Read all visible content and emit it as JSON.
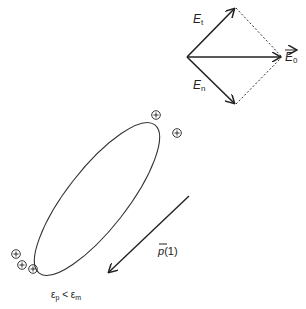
{
  "vectors": {
    "tangential": {
      "symbol": "E",
      "subscript": "t"
    },
    "normal": {
      "symbol": "E",
      "subscript": "n"
    },
    "resultant": {
      "symbol": "E",
      "subscript": "0",
      "overarrow": true
    }
  },
  "particle": {
    "shape": "ellipse",
    "charge_symbol": "⊕",
    "top_charges": 2,
    "bottom_charges": 3
  },
  "polarization": {
    "symbol": "p",
    "argument": "(1)",
    "overbar": true
  },
  "condition": {
    "left": "ε",
    "left_sub": "p",
    "relation": "<",
    "right": "ε",
    "right_sub": "m"
  },
  "colors": {
    "line": "#222222",
    "background": "#ffffff"
  }
}
